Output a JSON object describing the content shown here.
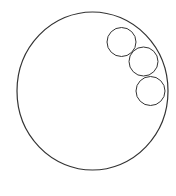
{
  "diagram": {
    "canvas": {
      "width": 176,
      "height": 196,
      "background": "#ffffff"
    },
    "stroke_color": "#333333",
    "large_circle": {
      "cx": 92.5,
      "cy": 91,
      "rx": 75.5,
      "ry": 79,
      "stroke_width": 1.2
    },
    "small_circles": [
      {
        "cx": 121.5,
        "cy": 42,
        "r": 14.5,
        "stroke_width": 1
      },
      {
        "cx": 143.5,
        "cy": 61.5,
        "r": 14.5,
        "stroke_width": 1
      },
      {
        "cx": 150.5,
        "cy": 91,
        "r": 14.5,
        "stroke_width": 1
      }
    ]
  }
}
